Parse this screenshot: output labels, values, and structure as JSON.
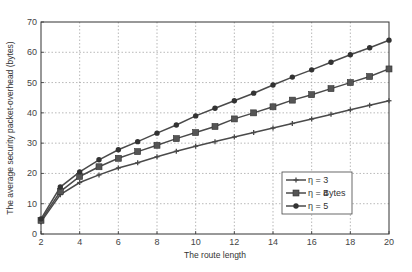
{
  "chart_data": {
    "type": "line",
    "title": "",
    "xlabel": "The route length",
    "ylabel": "The average security packet-overhead (bytes)",
    "xlim": [
      2,
      20
    ],
    "ylim": [
      0,
      70
    ],
    "xticks": [
      2,
      4,
      6,
      8,
      10,
      12,
      14,
      16,
      18,
      20
    ],
    "yticks": [
      0,
      10,
      20,
      30,
      40,
      50,
      60,
      70
    ],
    "grid": true,
    "legend_position": "lower right",
    "legend_unit_label": "Bytes",
    "x": [
      2,
      3,
      4,
      5,
      6,
      7,
      8,
      9,
      10,
      11,
      12,
      13,
      14,
      15,
      16,
      17,
      18,
      19,
      20
    ],
    "series": [
      {
        "name": "η = 3",
        "marker": "plus",
        "values": [
          4,
          13,
          17,
          19.5,
          21.8,
          23.5,
          25.5,
          27.3,
          29,
          30.5,
          32,
          33.5,
          35,
          36.5,
          38,
          39.5,
          41,
          42.5,
          44
        ]
      },
      {
        "name": "η = 4",
        "marker": "square",
        "values": [
          4.5,
          14,
          19,
          22.2,
          25,
          27.2,
          29.3,
          31.5,
          33.5,
          35.5,
          38,
          40,
          42,
          44.2,
          46,
          48,
          50,
          52,
          54.5
        ]
      },
      {
        "name": "η = 5",
        "marker": "circle",
        "values": [
          5,
          15.5,
          20.5,
          24.5,
          27.8,
          30.5,
          33.3,
          36,
          39,
          41.5,
          44,
          46.5,
          49.2,
          51.8,
          54.2,
          56.7,
          59.2,
          61.5,
          64
        ]
      }
    ]
  },
  "colors": {
    "line": "#4a4a4a",
    "grid": "#9a9a9a",
    "axis": "#333333"
  }
}
